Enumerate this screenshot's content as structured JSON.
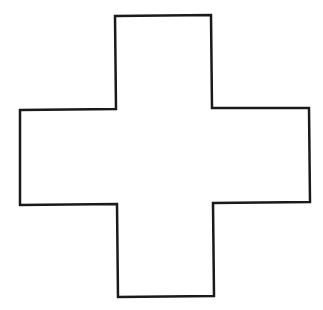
{
  "figure": {
    "shape": "cross",
    "stroke_color": "#1a1a1a",
    "fill_color": "#ffffff",
    "stroke_width": 2.5,
    "points": "115,16 211,15 212,108 309,108 310,202 213,203 214,296 118,297 117,204 20,205 20,110 116,109"
  }
}
